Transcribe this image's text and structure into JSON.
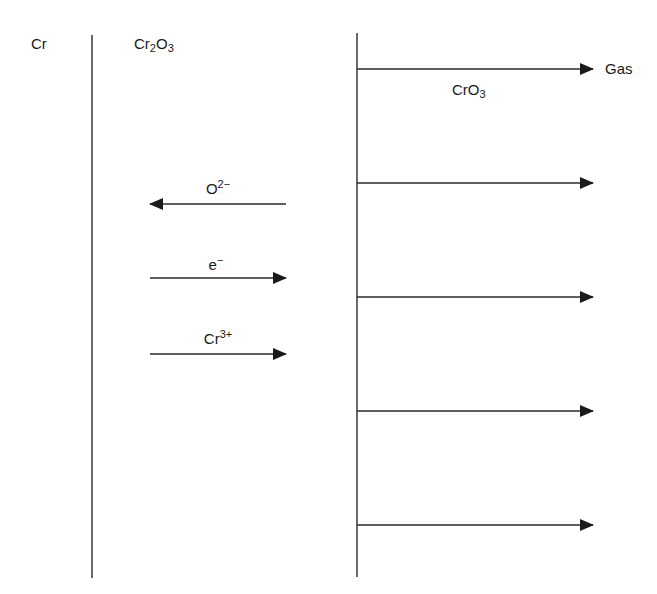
{
  "diagram": {
    "colors": {
      "stroke": "#2a2a2a",
      "background": "#ffffff"
    },
    "regions": {
      "metal": {
        "label": "Cr"
      },
      "oxide": {
        "label_base": "Cr",
        "label_sub1": "2",
        "label_mid": "O",
        "label_sub2": "3"
      },
      "gas": {
        "label": "Gas"
      }
    },
    "volatile_species": {
      "base": "CrO",
      "sub": "3"
    },
    "interfaces": [
      {
        "name": "metal-oxide",
        "x": 92,
        "y1": 35,
        "y2": 578
      },
      {
        "name": "oxide-gas",
        "x": 357,
        "y1": 33,
        "y2": 577
      }
    ],
    "transport_arrows": [
      {
        "species_base": "O",
        "species_sup": "2−",
        "direction": "left",
        "x1": 286,
        "x2": 150,
        "y": 204
      },
      {
        "species_base": "e",
        "species_sup": "−",
        "direction": "right",
        "x1": 150,
        "x2": 286,
        "y": 278
      },
      {
        "species_base": "Cr",
        "species_sup": "3+",
        "direction": "right",
        "x1": 150,
        "x2": 286,
        "y": 354
      }
    ],
    "evaporation_arrows": [
      {
        "x1": 357,
        "x2": 593,
        "y": 69
      },
      {
        "x1": 357,
        "x2": 593,
        "y": 183
      },
      {
        "x1": 357,
        "x2": 593,
        "y": 297
      },
      {
        "x1": 357,
        "x2": 593,
        "y": 411
      },
      {
        "x1": 357,
        "x2": 593,
        "y": 525
      }
    ]
  }
}
